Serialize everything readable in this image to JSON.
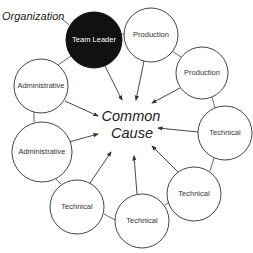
{
  "diagram": {
    "title_label": "Organization",
    "center": {
      "line1": "Common",
      "line2": "Cause",
      "x": 131,
      "y": 121
    },
    "colors": {
      "leader_fill": "#111111",
      "node_fill": "#ffffff",
      "stroke": "#444444"
    },
    "nodes": [
      {
        "id": "team-leader",
        "label": "Team Leader",
        "x": 94,
        "y": 40,
        "r": 28,
        "leader": true
      },
      {
        "id": "production-1",
        "label": "Production",
        "x": 151,
        "y": 35,
        "r": 27,
        "leader": false
      },
      {
        "id": "production-2",
        "label": "Production",
        "x": 202,
        "y": 73,
        "r": 26,
        "leader": false
      },
      {
        "id": "technical-1",
        "label": "Technical",
        "x": 225,
        "y": 133,
        "r": 27,
        "leader": false
      },
      {
        "id": "technical-2",
        "label": "Technical",
        "x": 194,
        "y": 194,
        "r": 27,
        "leader": false
      },
      {
        "id": "technical-3",
        "label": "Technical",
        "x": 142,
        "y": 221,
        "r": 27,
        "leader": false
      },
      {
        "id": "technical-4",
        "label": "Technical",
        "x": 77,
        "y": 207,
        "r": 27,
        "leader": false
      },
      {
        "id": "administrative-2",
        "label": "Administrative",
        "x": 42,
        "y": 152,
        "r": 30,
        "leader": false
      },
      {
        "id": "administrative-1",
        "label": "Administrative",
        "x": 41,
        "y": 86,
        "r": 27,
        "leader": false
      }
    ],
    "arrows": [
      {
        "from": "team-leader",
        "x1": 105,
        "y1": 66,
        "x2": 122,
        "y2": 100
      },
      {
        "from": "production-1",
        "x1": 144,
        "y1": 61,
        "x2": 136,
        "y2": 100
      },
      {
        "from": "production-2",
        "x1": 180,
        "y1": 88,
        "x2": 152,
        "y2": 103
      },
      {
        "from": "technical-1",
        "x1": 198,
        "y1": 132,
        "x2": 158,
        "y2": 128
      },
      {
        "from": "technical-2",
        "x1": 178,
        "y1": 172,
        "x2": 152,
        "y2": 146
      },
      {
        "from": "technical-3",
        "x1": 137,
        "y1": 194,
        "x2": 134,
        "y2": 156
      },
      {
        "from": "technical-4",
        "x1": 90,
        "y1": 183,
        "x2": 111,
        "y2": 152
      },
      {
        "from": "administrative-2",
        "x1": 69,
        "y1": 142,
        "x2": 98,
        "y2": 134
      },
      {
        "from": "administrative-1",
        "x1": 65,
        "y1": 101,
        "x2": 98,
        "y2": 116
      }
    ],
    "links": [
      {
        "x1": 122,
        "y1": 34,
        "x2": 124,
        "y2": 34
      },
      {
        "x1": 172,
        "y1": 51,
        "x2": 181,
        "y2": 57
      },
      {
        "x1": 212,
        "y1": 97,
        "x2": 215,
        "y2": 108
      },
      {
        "x1": 214,
        "y1": 158,
        "x2": 210,
        "y2": 171
      },
      {
        "x1": 168,
        "y1": 203,
        "x2": 165,
        "y2": 205
      },
      {
        "x1": 115,
        "y1": 220,
        "x2": 104,
        "y2": 214
      },
      {
        "x1": 61,
        "y1": 184,
        "x2": 55,
        "y2": 178
      },
      {
        "x1": 34,
        "y1": 122,
        "x2": 34,
        "y2": 112
      },
      {
        "x1": 58,
        "y1": 65,
        "x2": 71,
        "y2": 56
      },
      {
        "x1": 61,
        "y1": 18,
        "x2": 69,
        "y2": 25
      }
    ],
    "org_label_pos": {
      "x": 2,
      "y": 20
    }
  }
}
